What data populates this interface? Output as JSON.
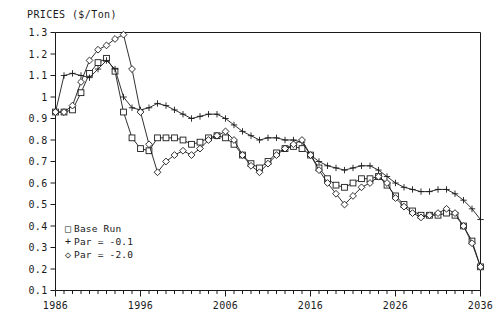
{
  "chart_data": {
    "type": "line",
    "title": "PRICES ($/Ton)",
    "xlabel": "",
    "ylabel": "",
    "xlim": [
      1986,
      2036
    ],
    "ylim": [
      0.1,
      1.3
    ],
    "ytick_step": 0.1,
    "xtick_step": 1,
    "xtick_major_step": 10,
    "grid": false,
    "legend_position": "bottom-left",
    "xticks": [
      1986,
      1996,
      2006,
      2016,
      2026,
      2036
    ],
    "xtick_labels": [
      "1986",
      "1996",
      "2006",
      "2016",
      "2026",
      "2036"
    ],
    "yticks": [
      0.1,
      0.2,
      0.3,
      0.4,
      0.5,
      0.6,
      0.7,
      0.8,
      0.9,
      1.0,
      1.1,
      1.2,
      1.3
    ],
    "ytick_labels": [
      "0.1",
      "0.2",
      "0.3",
      "0.4",
      "0.5",
      "0.6",
      "0.7",
      "0.8",
      "0.9",
      "1",
      "1.1",
      "1.2",
      "1.3"
    ],
    "x": [
      1986,
      1987,
      1988,
      1989,
      1990,
      1991,
      1992,
      1993,
      1994,
      1995,
      1996,
      1997,
      1998,
      1999,
      2000,
      2001,
      2002,
      2003,
      2004,
      2005,
      2006,
      2007,
      2008,
      2009,
      2010,
      2011,
      2012,
      2013,
      2014,
      2015,
      2016,
      2017,
      2018,
      2019,
      2020,
      2021,
      2022,
      2023,
      2024,
      2025,
      2026,
      2027,
      2028,
      2029,
      2030,
      2031,
      2032,
      2033,
      2034,
      2035,
      2036
    ],
    "series": [
      {
        "name": "Base Run",
        "marker": "square",
        "marker_glyph": "□",
        "color": "#1a1a1a",
        "values": [
          0.93,
          0.93,
          0.94,
          1.02,
          1.11,
          1.16,
          1.18,
          1.12,
          0.93,
          0.81,
          0.76,
          0.75,
          0.81,
          0.81,
          0.81,
          0.8,
          0.78,
          0.79,
          0.81,
          0.82,
          0.81,
          0.78,
          0.73,
          0.69,
          0.67,
          0.7,
          0.74,
          0.76,
          0.77,
          0.76,
          0.73,
          0.67,
          0.62,
          0.59,
          0.58,
          0.6,
          0.62,
          0.62,
          0.63,
          0.59,
          0.54,
          0.5,
          0.47,
          0.45,
          0.45,
          0.45,
          0.46,
          0.45,
          0.4,
          0.33,
          0.21
        ]
      },
      {
        "name": "Par = -0.1",
        "marker": "plus",
        "marker_glyph": "+",
        "color": "#1a1a1a",
        "values": [
          0.93,
          1.1,
          1.11,
          1.1,
          1.09,
          1.13,
          1.17,
          1.13,
          1.0,
          0.95,
          0.94,
          0.95,
          0.97,
          0.96,
          0.94,
          0.92,
          0.9,
          0.91,
          0.92,
          0.92,
          0.9,
          0.87,
          0.84,
          0.82,
          0.8,
          0.81,
          0.81,
          0.8,
          0.8,
          0.79,
          0.73,
          0.7,
          0.68,
          0.67,
          0.66,
          0.67,
          0.68,
          0.68,
          0.66,
          0.63,
          0.6,
          0.58,
          0.57,
          0.56,
          0.56,
          0.57,
          0.57,
          0.55,
          0.52,
          0.48,
          0.43
        ]
      },
      {
        "name": "Par = -2.0",
        "marker": "diamond",
        "marker_glyph": "◇",
        "color": "#1a1a1a",
        "values": [
          0.93,
          0.93,
          0.96,
          1.07,
          1.17,
          1.22,
          1.24,
          1.27,
          1.29,
          1.13,
          0.93,
          0.78,
          0.65,
          0.7,
          0.73,
          0.75,
          0.73,
          0.76,
          0.8,
          0.82,
          0.84,
          0.8,
          0.73,
          0.68,
          0.65,
          0.69,
          0.73,
          0.76,
          0.78,
          0.8,
          0.73,
          0.66,
          0.6,
          0.55,
          0.5,
          0.54,
          0.58,
          0.6,
          0.63,
          0.6,
          0.53,
          0.49,
          0.46,
          0.44,
          0.45,
          0.46,
          0.48,
          0.46,
          0.4,
          0.32,
          0.21
        ]
      }
    ]
  },
  "legend": {
    "items": [
      {
        "glyph": "□",
        "label": "Base Run"
      },
      {
        "glyph": "+",
        "label": "Par = -0.1"
      },
      {
        "glyph": "◇",
        "label": "Par = -2.0"
      }
    ]
  }
}
